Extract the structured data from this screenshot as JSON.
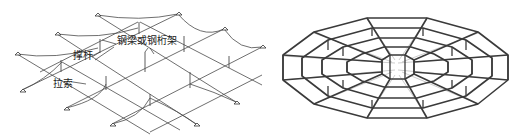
{
  "figures": [
    {
      "id": "left",
      "description": "Cable-strut grid structure (isometric view)",
      "labels": {
        "beam": "钢梁或钢桁架",
        "strut": "撑杆",
        "cable": "拉索"
      }
    },
    {
      "id": "right",
      "description": "Radial ring cable-strut structure (perspective view)"
    }
  ],
  "colors": {
    "line": "#444444",
    "thick_line": "#3a3a3a",
    "thin_line": "#8a8a8a",
    "text": "#222222",
    "background": "#ffffff"
  }
}
